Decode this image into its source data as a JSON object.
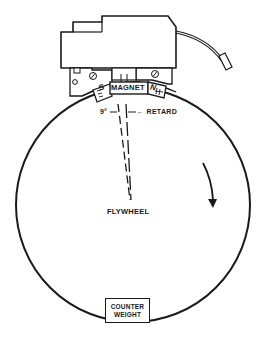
{
  "diagram": {
    "labels": {
      "magnet": "MAGNET",
      "south_pole": "S",
      "north_pole": "N",
      "angle": "9°",
      "retard": "← RETARD",
      "flywheel": "FLYWHEEL",
      "counter_weight_line1": "COUNTER",
      "counter_weight_line2": "WEIGHT"
    },
    "parts": [
      "ignition-coil-housing",
      "lead-wire",
      "mounting-bracket",
      "south-pole-shoe",
      "magnet",
      "north-pole-shoe",
      "timing-lines",
      "flywheel-rim",
      "rotation-arrow",
      "counter-weight"
    ],
    "rotation_direction": "clockwise",
    "retard_angle_degrees": 9,
    "colors": {
      "ink": "#1a1a1a",
      "background": "#ffffff"
    }
  }
}
